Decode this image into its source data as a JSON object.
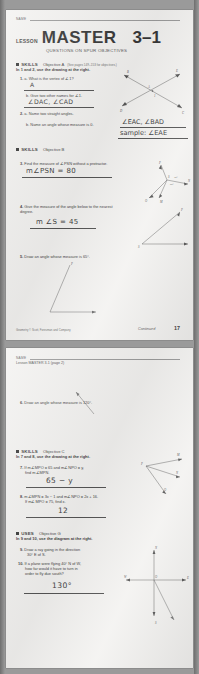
{
  "document": {
    "title": "Lesson Master 3-1",
    "worksheet_series": "QUESTIONS ON SPUR OBJECTIVES"
  },
  "page1": {
    "name_label": "NAME",
    "lesson_word": "LESSON",
    "master_word": "MASTER",
    "lesson_number": "3–1",
    "spur_line": "QUESTIONS ON SPUR OBJECTIVES",
    "section_a": {
      "kind": "SKILLS",
      "objective": "Objective A",
      "note": "(See pages 149–153 for objectives.)",
      "directions": "In 1 and 2, use the drawing at the right."
    },
    "q1": {
      "number": "1.",
      "part_a": "a.  What is the vertex of ∠1?",
      "answer_a": "A",
      "part_b": "b.  Give two other names for ∠1.",
      "answer_b": "∠DAC, ∠CAD"
    },
    "q2": {
      "number": "2.",
      "part_a": "a.  Name two straight angles.",
      "part_b": "b.  Name an angle whose measure is 0."
    },
    "box_answer_line1": "∠EAC, ∠BAD",
    "box_answer_line2": "sample: ∠EAE",
    "section_b": {
      "kind": "SKILLS",
      "objective": "Objective B"
    },
    "q3": {
      "number": "3.",
      "text": "Find the measure of ∠PSN without a protractor.",
      "answer": "m∠PSN = 80"
    },
    "q4": {
      "number": "4.",
      "text": "Give the measure of the angle below to the nearest degree.",
      "answer": "m ∠S = 45"
    },
    "q5": {
      "number": "5.",
      "text": "Draw an angle whose measure is 65°."
    },
    "footer_left": "Geometry © Scott, Foresman and Company",
    "footer_continued": "Continued",
    "footer_page": "17",
    "diagram_labels": {
      "fig1": [
        "E",
        "B",
        "D",
        "C",
        "A",
        "1"
      ],
      "fig3": [
        "P",
        "S",
        "N",
        "O",
        "M"
      ],
      "fig4": [
        "S"
      ]
    }
  },
  "page2": {
    "name_label": "NAME",
    "header": "Lesson MASTER 3-1 (page 2)",
    "q6": {
      "number": "6.",
      "text": "Draw an angle whose measure is 120°."
    },
    "section_c": {
      "kind": "SKILLS",
      "objective": "Objective C",
      "directions": "In 7 and 8, use the drawing at the right."
    },
    "q7": {
      "number": "7.",
      "line1": "If m∠MPO = 65 and m∠NPO = y,",
      "line2": "find m∠MPN.",
      "answer": "65 − y"
    },
    "q8": {
      "number": "8.",
      "line1": "m∠MPN = 3x − 1 and m∠NPO = 2x + 16.",
      "line2": "If m∠MPO = 75, find x.",
      "answer": "12"
    },
    "section_d": {
      "kind": "USES",
      "objective": "Objective G",
      "directions": "In 9 and 10, use the diagram at the right."
    },
    "q9": {
      "number": "9.",
      "line1": "Draw a ray going in the direction",
      "line2": "30° E of S."
    },
    "q10": {
      "number": "10.",
      "line1": "If a plane were flying 40° N of W,",
      "line2": "how far would it have to turn in",
      "line3": "order to fly due south?",
      "answer": "130°"
    },
    "diagram_labels": {
      "rays": [
        "M",
        "N",
        "O",
        "P"
      ],
      "compass": [
        "N",
        "S",
        "E",
        "W"
      ]
    }
  }
}
